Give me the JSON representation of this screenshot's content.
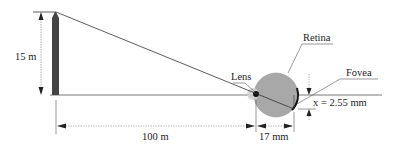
{
  "diagram": {
    "labels": {
      "height": "15 m",
      "lens": "Lens",
      "retina": "Retina",
      "fovea": "Fovea",
      "image_size": "x = 2.55 mm",
      "object_distance": "100 m",
      "eye_length": "17 mm"
    },
    "colors": {
      "tree": "#444444",
      "eye": "#a8a8a8",
      "lens_halo": "#cfcfcf",
      "lens": "#111111",
      "line": "#333333",
      "dim_line": "#9a9a9a"
    }
  }
}
